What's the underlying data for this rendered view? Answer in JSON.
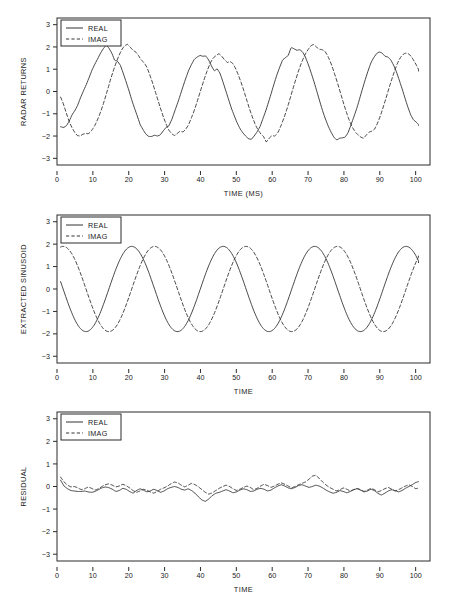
{
  "figure": {
    "title": "",
    "panel_count": 3,
    "line_color": "#333333"
  },
  "chart_data": [
    {
      "type": "line",
      "title": "",
      "xlabel": "TIME (MS)",
      "ylabel": "RADAR RETURNS",
      "xlim": [
        0,
        104
      ],
      "ylim": [
        -3.3,
        3.3
      ],
      "xticks": [
        0,
        10,
        20,
        30,
        40,
        50,
        60,
        70,
        80,
        90,
        100
      ],
      "yticks": [
        -3,
        -2,
        -1,
        0,
        1,
        2,
        3
      ],
      "grid": false,
      "legend": [
        "REAL",
        "IMAG"
      ],
      "legend_position": "top-left",
      "description": "Noisy complex radar return: sinusoid of amplitude ~1.9 and period ~25.5 ms plus additive noise.",
      "series": [
        {
          "name": "REAL",
          "style": "solid",
          "amplitude": 1.9,
          "period": 25.5,
          "phase_deg": -190,
          "noise_amplitude": 0.26,
          "values": [
            -1.58,
            -1.62,
            -1.55,
            -1.34,
            -1.05,
            -0.86,
            -0.62,
            -0.28,
            0.02,
            0.3,
            0.62,
            0.95,
            1.22,
            1.46,
            1.72,
            1.92,
            2.08,
            1.95,
            1.72,
            1.4,
            1.36,
            1.18,
            0.82,
            0.44,
            0.05,
            -0.38,
            -0.76,
            -1.12,
            -1.5,
            -1.72,
            -1.92,
            -2.02,
            -2.02,
            -1.96,
            -2.0,
            -1.95,
            -1.78,
            -1.62,
            -1.55,
            -1.28,
            -0.92,
            -0.56,
            -0.18,
            0.22,
            0.6,
            0.95,
            1.22,
            1.45,
            1.55,
            1.62,
            1.58,
            1.6,
            1.42,
            1.15,
            0.92,
            1.02,
            0.82,
            0.45,
            0.05,
            -0.35,
            -0.75,
            -1.08,
            -1.4,
            -1.66,
            -1.85,
            -2.0,
            -2.12,
            -2.15,
            -2.0,
            -1.82,
            -1.6,
            -1.25,
            -0.9,
            -0.5,
            -0.08,
            0.35,
            0.75,
            1.1,
            1.42,
            1.52,
            1.62,
            1.98,
            1.92,
            1.85,
            1.88,
            1.78,
            1.55,
            1.22,
            0.85,
            0.45,
            0.02,
            -0.42,
            -0.85,
            -1.22,
            -1.55,
            -1.82,
            -2.05,
            -2.18,
            -2.1,
            -2.08,
            -2.05,
            -1.85,
            -1.5,
            -1.15,
            -0.78,
            -0.35,
            0.1,
            0.52,
            0.92,
            1.28,
            1.52,
            1.7,
            1.78,
            1.72,
            1.58,
            1.55,
            1.42,
            1.18,
            0.88,
            0.5,
            0.12,
            -0.3,
            -0.7,
            -1.05,
            -1.28,
            -1.38,
            -1.52
          ]
        },
        {
          "name": "IMAG",
          "style": "dashed",
          "amplitude": 1.9,
          "period": 25.5,
          "phase_deg": -280,
          "noise_amplitude": 0.26,
          "values": [
            -0.25,
            -0.55,
            -0.95,
            -1.32,
            -1.6,
            -1.82,
            -1.98,
            -2.0,
            -1.92,
            -1.88,
            -1.9,
            -1.78,
            -1.6,
            -1.35,
            -1.05,
            -0.7,
            -0.3,
            0.12,
            0.55,
            0.95,
            1.3,
            1.62,
            1.88,
            2.05,
            2.12,
            2.0,
            1.85,
            1.78,
            1.62,
            1.42,
            1.3,
            1.1,
            0.78,
            0.42,
            0.02,
            -0.38,
            -0.78,
            -1.15,
            -1.48,
            -1.75,
            -1.9,
            -1.98,
            -1.88,
            -1.78,
            -1.82,
            -1.7,
            -1.5,
            -1.2,
            -0.88,
            -0.5,
            -0.1,
            0.3,
            0.68,
            1.02,
            1.32,
            1.52,
            1.62,
            1.7,
            1.58,
            1.42,
            1.3,
            1.35,
            1.25,
            1.02,
            0.72,
            0.38,
            0.0,
            -0.4,
            -0.8,
            -1.15,
            -1.48,
            -1.72,
            -1.9,
            -2.02,
            -2.28,
            -2.1,
            -1.98,
            -2.0,
            -1.88,
            -1.62,
            -1.3,
            -0.95,
            -0.55,
            -0.12,
            0.3,
            0.7,
            1.08,
            1.4,
            1.68,
            1.88,
            2.05,
            2.12,
            2.0,
            1.9,
            1.88,
            1.82,
            1.62,
            1.35,
            1.0,
            0.62,
            0.22,
            -0.2,
            -0.62,
            -1.0,
            -1.35,
            -1.62,
            -1.82,
            -1.95,
            -2.05,
            -2.1,
            -1.95,
            -1.82,
            -1.78,
            -1.68,
            -1.42,
            -1.1,
            -0.72,
            -0.32,
            0.1,
            0.5,
            0.88,
            1.22,
            1.48,
            1.65,
            1.72,
            1.7,
            1.6,
            1.4,
            1.18,
            0.92
          ]
        }
      ]
    },
    {
      "type": "line",
      "title": "",
      "xlabel": "TIME",
      "ylabel": "EXTRACTED SINUSOID",
      "xlim": [
        0,
        104
      ],
      "ylim": [
        -3.3,
        3.3
      ],
      "xticks": [
        0,
        10,
        20,
        30,
        40,
        50,
        60,
        70,
        80,
        90,
        100
      ],
      "yticks": [
        -3,
        -2,
        -1,
        0,
        1,
        2,
        3
      ],
      "grid": false,
      "legend": [
        "REAL",
        "IMAG"
      ],
      "legend_position": "top-left",
      "description": "Clean fitted complex sinusoid: amplitude 1.9, period 25.5, IMAG lags REAL by ~90 degrees.",
      "series": [
        {
          "name": "REAL",
          "style": "solid",
          "amplitude": 1.9,
          "period": 25.5,
          "phase_deg": -190,
          "noise_amplitude": 0
        },
        {
          "name": "IMAG",
          "style": "dashed",
          "amplitude": 1.9,
          "period": 25.5,
          "phase_deg": -280,
          "noise_amplitude": 0
        }
      ]
    },
    {
      "type": "line",
      "title": "",
      "xlabel": "TIME",
      "ylabel": "RESIDUAL",
      "xlim": [
        0,
        104
      ],
      "ylim": [
        -3.3,
        3.3
      ],
      "xticks": [
        0,
        10,
        20,
        30,
        40,
        50,
        60,
        70,
        80,
        90,
        100
      ],
      "yticks": [
        -3,
        -2,
        -1,
        0,
        1,
        2,
        3
      ],
      "grid": false,
      "legend": [
        "REAL",
        "IMAG"
      ],
      "legend_position": "top-left",
      "description": "Residual after removing the fitted sinusoid; small-amplitude noise centered near zero, range about -0.7 to +0.5.",
      "series": [
        {
          "name": "REAL",
          "style": "solid",
          "noise_amplitude": 0.2,
          "values": [
            0.28,
            0.02,
            -0.1,
            -0.18,
            -0.2,
            -0.22,
            -0.22,
            -0.2,
            -0.24,
            -0.26,
            -0.22,
            -0.14,
            -0.06,
            -0.02,
            -0.05,
            -0.12,
            -0.22,
            -0.18,
            -0.08,
            -0.12,
            -0.22,
            -0.3,
            -0.18,
            -0.1,
            -0.16,
            -0.24,
            -0.2,
            -0.12,
            -0.18,
            -0.26,
            -0.2,
            -0.1,
            -0.04,
            0.0,
            -0.04,
            -0.12,
            -0.16,
            -0.1,
            -0.18,
            -0.3,
            -0.46,
            -0.6,
            -0.66,
            -0.55,
            -0.4,
            -0.3,
            -0.26,
            -0.2,
            -0.14,
            -0.2,
            -0.28,
            -0.24,
            -0.16,
            -0.1,
            -0.14,
            -0.22,
            -0.2,
            -0.12,
            -0.08,
            -0.12,
            -0.2,
            -0.16,
            -0.06,
            0.02,
            0.08,
            0.02,
            -0.06,
            -0.1,
            -0.04,
            0.04,
            0.08,
            0.02,
            -0.04,
            0.0,
            0.06,
            0.02,
            -0.06,
            -0.16,
            -0.24,
            -0.3,
            -0.26,
            -0.18,
            -0.22,
            -0.28,
            -0.22,
            -0.14,
            -0.1,
            -0.16,
            -0.24,
            -0.2,
            -0.12,
            -0.18,
            -0.3,
            -0.38,
            -0.3,
            -0.2,
            -0.14,
            -0.18,
            -0.24,
            -0.18,
            -0.08,
            0.0,
            0.08,
            0.18,
            0.22
          ]
        },
        {
          "name": "IMAG",
          "style": "dashed",
          "noise_amplitude": 0.2,
          "values": [
            0.42,
            0.2,
            0.06,
            -0.02,
            0.0,
            -0.06,
            -0.14,
            -0.1,
            -0.02,
            -0.08,
            -0.16,
            -0.1,
            0.0,
            0.08,
            0.12,
            0.06,
            -0.02,
            0.02,
            0.1,
            0.04,
            -0.06,
            -0.18,
            -0.26,
            -0.2,
            -0.12,
            -0.16,
            -0.24,
            -0.3,
            -0.22,
            -0.12,
            -0.06,
            0.02,
            0.12,
            0.2,
            0.16,
            0.06,
            -0.02,
            0.06,
            0.14,
            0.08,
            -0.02,
            -0.14,
            -0.26,
            -0.34,
            -0.28,
            -0.18,
            -0.08,
            0.0,
            0.06,
            0.0,
            -0.1,
            -0.18,
            -0.12,
            -0.04,
            0.02,
            -0.04,
            -0.14,
            -0.08,
            0.02,
            0.1,
            0.04,
            -0.04,
            0.02,
            0.1,
            0.16,
            0.1,
            0.02,
            -0.06,
            0.0,
            0.08,
            0.14,
            0.2,
            0.32,
            0.46,
            0.5,
            0.36,
            0.2,
            0.06,
            -0.04,
            -0.12,
            -0.2,
            -0.14,
            -0.06,
            -0.12,
            -0.2,
            -0.14,
            -0.08,
            -0.14,
            -0.22,
            -0.16,
            -0.08,
            -0.14,
            -0.24,
            -0.18,
            -0.1,
            -0.04,
            -0.12,
            -0.2,
            -0.14,
            -0.06,
            0.02,
            0.08,
            0.0,
            -0.1,
            -0.06
          ]
        }
      ]
    }
  ]
}
